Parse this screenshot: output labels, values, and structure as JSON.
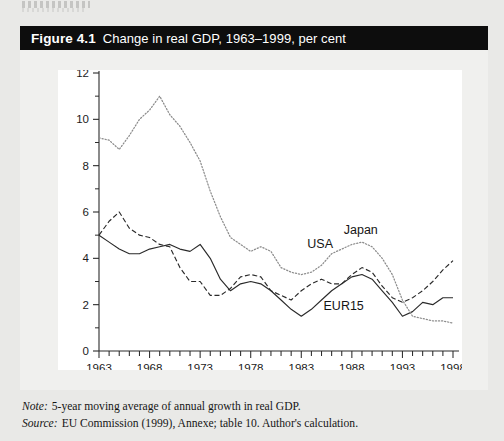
{
  "page": {
    "top_fragment": ""
  },
  "figure": {
    "number": "Figure 4.1",
    "title": "Change in real GDP, 1963–1999, per cent"
  },
  "notes": [
    {
      "key": "Note:",
      "text": "5-year moving average of annual growth in real GDP."
    },
    {
      "key": "Source:",
      "text": "EU Commission (1999), Annexe; table 10. Author's calculation."
    }
  ],
  "chart_data": {
    "type": "line",
    "title": "Change in real GDP, 1963–1999, per cent",
    "xlabel": "",
    "ylabel": "",
    "xlim": [
      1963,
      1998
    ],
    "ylim": [
      0,
      12
    ],
    "ytick_values": [
      0,
      2,
      4,
      6,
      8,
      10,
      12
    ],
    "ytick_labels": [
      "0",
      "2",
      "4",
      "6",
      "8",
      "10",
      "12"
    ],
    "yminor_values": [
      1,
      3,
      5,
      7,
      9,
      11
    ],
    "xtick_labels": [
      "1963",
      "1968",
      "1973",
      "1978",
      "1983",
      "1988",
      "1993",
      "1998"
    ],
    "xtick_values": [
      1963,
      1968,
      1973,
      1978,
      1983,
      1988,
      1993,
      1998
    ],
    "xminor_step": 1,
    "grid": false,
    "legend": "inline-labels",
    "x": [
      1963,
      1964,
      1965,
      1966,
      1967,
      1968,
      1969,
      1970,
      1971,
      1972,
      1973,
      1974,
      1975,
      1976,
      1977,
      1978,
      1979,
      1980,
      1981,
      1982,
      1983,
      1984,
      1985,
      1986,
      1987,
      1988,
      1989,
      1990,
      1991,
      1992,
      1993,
      1994,
      1995,
      1996,
      1997,
      1998
    ],
    "series": [
      {
        "name": "EUR15",
        "style": "solid",
        "color": "#2a2a2a",
        "label_x": 1985.2,
        "label_y": 1.75,
        "values": [
          5.0,
          4.7,
          4.4,
          4.2,
          4.2,
          4.4,
          4.5,
          4.6,
          4.4,
          4.3,
          4.6,
          4.0,
          3.1,
          2.6,
          2.9,
          3.0,
          2.9,
          2.6,
          2.2,
          1.8,
          1.5,
          1.8,
          2.2,
          2.6,
          2.9,
          3.2,
          3.3,
          3.1,
          2.6,
          2.1,
          1.5,
          1.7,
          2.1,
          2.0,
          2.3,
          2.3
        ]
      },
      {
        "name": "USA",
        "style": "dashed",
        "color": "#2a2a2a",
        "label_x": 1983.6,
        "label_y": 4.45,
        "values": [
          5.0,
          5.6,
          6.0,
          5.3,
          5.0,
          4.9,
          4.6,
          4.5,
          3.6,
          3.0,
          3.0,
          2.4,
          2.4,
          2.7,
          3.2,
          3.3,
          3.2,
          2.6,
          2.4,
          2.2,
          2.6,
          2.9,
          3.1,
          2.9,
          2.9,
          3.3,
          3.6,
          3.4,
          2.8,
          2.3,
          2.1,
          2.3,
          2.6,
          3.0,
          3.5,
          3.9
        ]
      },
      {
        "name": "Japan",
        "style": "dotted",
        "color": "#8c8c8c",
        "label_x": 1987.2,
        "label_y": 5.05,
        "values": [
          9.2,
          9.1,
          8.7,
          9.3,
          10.0,
          10.4,
          11.0,
          10.2,
          9.7,
          9.0,
          8.2,
          6.9,
          5.8,
          4.9,
          4.6,
          4.3,
          4.5,
          4.3,
          3.6,
          3.4,
          3.3,
          3.4,
          3.7,
          4.2,
          4.4,
          4.6,
          4.7,
          4.5,
          4.0,
          3.3,
          2.2,
          1.5,
          1.4,
          1.3,
          1.3,
          1.2
        ]
      }
    ]
  }
}
